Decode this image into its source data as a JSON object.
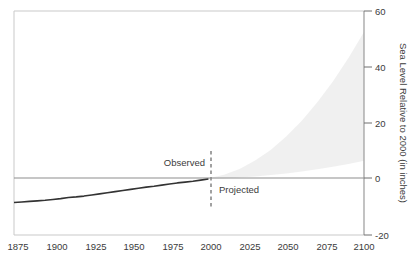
{
  "chart_data": {
    "type": "line",
    "title": "",
    "title_fragment_visible": "",
    "xlabel": "",
    "ylabel": "Sea Level Relative to 2000 (in inches)",
    "xlim": [
      1875,
      2100
    ],
    "ylim": [
      -20,
      60
    ],
    "grid": false,
    "legend": "none",
    "xticks": [
      "1875",
      "1900",
      "1925",
      "1950",
      "1975",
      "2000",
      "2025",
      "2050",
      "2075",
      "2100"
    ],
    "xtick_values": [
      1875,
      1900,
      1925,
      1950,
      1975,
      2000,
      2025,
      2050,
      2075,
      2100
    ],
    "yticks": [
      "60",
      "40",
      "20",
      "0",
      "-20"
    ],
    "ytick_values": [
      60,
      40,
      20,
      0,
      -20
    ],
    "zero_reference_line": 0,
    "divider_year": 2000,
    "annotations": [
      {
        "text": "Observed",
        "x": 1988,
        "y": 4.5,
        "align": "right"
      },
      {
        "text": "Projected",
        "x": 2012,
        "y": -3.5,
        "align": "left"
      }
    ],
    "series": [
      {
        "name": "Observed sea level",
        "style": "solid-dark-line",
        "color": "#333333",
        "x": [
          1875,
          1880,
          1885,
          1890,
          1895,
          1900,
          1905,
          1910,
          1915,
          1920,
          1925,
          1930,
          1935,
          1940,
          1945,
          1950,
          1955,
          1960,
          1965,
          1970,
          1975,
          1980,
          1985,
          1990,
          1995,
          2000
        ],
        "values": [
          -8.4,
          -8.2,
          -8.0,
          -7.8,
          -7.6,
          -7.3,
          -7.0,
          -6.6,
          -6.4,
          -6.1,
          -5.7,
          -5.3,
          -4.9,
          -4.5,
          -4.1,
          -3.7,
          -3.3,
          -2.9,
          -2.6,
          -2.2,
          -1.8,
          -1.4,
          -1.1,
          -0.8,
          -0.4,
          0.0
        ]
      },
      {
        "name": "Projected range",
        "style": "shaded-fan",
        "color": "#ededed",
        "x": [
          2000,
          2010,
          2020,
          2030,
          2040,
          2050,
          2060,
          2070,
          2080,
          2090,
          2100
        ],
        "upper": [
          0.3,
          1.5,
          3.6,
          6.6,
          10.4,
          15.2,
          20.8,
          27.4,
          34.8,
          43.2,
          52.5
        ],
        "lower": [
          0.0,
          0.2,
          0.5,
          0.9,
          1.4,
          2.0,
          2.7,
          3.5,
          4.4,
          5.4,
          6.5
        ]
      }
    ]
  }
}
